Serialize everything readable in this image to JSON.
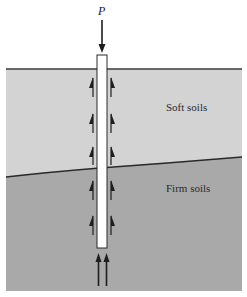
{
  "diagram": {
    "load_label": "P",
    "layers": [
      {
        "name": "soft-soil",
        "label": "Soft soils",
        "color": "#d3d3d3"
      },
      {
        "name": "firm-soil",
        "label": "Firm soils",
        "color": "#a9a9a9"
      }
    ],
    "colors": {
      "background": "#ffffff",
      "ground_line": "#3a3a3a",
      "boundary_line": "#2a2a2a",
      "pile_fill": "#ffffff",
      "pile_outline": "#2a2a2a",
      "arrow": "#1e1e1e"
    },
    "elements": {
      "pile": "Pile (vertical, white rectangle)",
      "load_arrow": "Downward load P at pile head",
      "skin_friction_arrows": "Upward half-arrows along both pile sides (6 pairs)",
      "end_bearing_arrows": "Two upward arrows at pile tip"
    }
  }
}
